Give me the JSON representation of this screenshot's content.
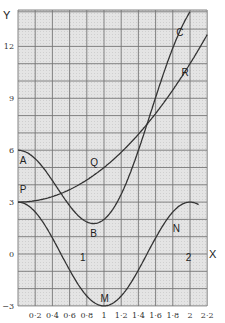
{
  "chart_data": {
    "type": "line",
    "title": "",
    "xlabel": "X",
    "ylabel": "Y",
    "xlim": [
      0,
      2.2
    ],
    "ylim": [
      -3,
      14.1
    ],
    "grid": true,
    "x_ticks": [
      "0·2",
      "0·4",
      "0·6",
      "0·8",
      "1",
      "1·2",
      "1·4",
      "1·6",
      "1·8",
      "2",
      "2·2"
    ],
    "y_ticks": [
      "12",
      "9",
      "6",
      "3",
      "0",
      "−3"
    ],
    "series": [
      {
        "name": "A-B-C",
        "labels": [
          "A",
          "B",
          "C"
        ],
        "x": [
          0,
          0.2,
          0.4,
          0.6,
          0.8,
          0.9,
          1.0,
          1.2,
          1.4,
          1.5,
          1.6,
          1.8,
          1.95
        ],
        "values": [
          6,
          5.93,
          4.25,
          2.79,
          1.86,
          1.77,
          2.0,
          3.46,
          5.85,
          7.5,
          9.19,
          11.91,
          14.4
        ]
      },
      {
        "name": "P-Q-R",
        "labels": [
          "P",
          "Q",
          "R"
        ],
        "x": [
          0,
          0.2,
          0.4,
          0.6,
          0.8,
          0.9,
          1.0,
          1.2,
          1.4,
          1.6,
          1.8,
          2.0,
          2.2
        ],
        "values": [
          3,
          3.08,
          3.32,
          3.72,
          4.28,
          4.62,
          5,
          5.88,
          6.92,
          8.12,
          9.48,
          11,
          12.68
        ]
      },
      {
        "name": "P-M-N",
        "labels": [
          "P",
          "M",
          "N"
        ],
        "x": [
          0,
          0.2,
          0.4,
          0.6,
          0.8,
          1.0,
          1.2,
          1.4,
          1.6,
          1.8,
          2.0,
          2.1
        ],
        "values": [
          3,
          2.43,
          0.93,
          -0.93,
          -2.43,
          -3,
          -2.43,
          -0.93,
          0.93,
          2.43,
          3,
          2.85
        ]
      }
    ],
    "annotations": [
      {
        "text": "A",
        "x": 0.02,
        "y": 5.2
      },
      {
        "text": "P",
        "x": 0.02,
        "y": 3.5
      },
      {
        "text": "Q",
        "x": 0.84,
        "y": 5.1
      },
      {
        "text": "B",
        "x": 0.84,
        "y": 1.0
      },
      {
        "text": "C",
        "x": 1.84,
        "y": 12.6
      },
      {
        "text": "R",
        "x": 1.9,
        "y": 10.3
      },
      {
        "text": "N",
        "x": 1.8,
        "y": 1.3
      },
      {
        "text": "M",
        "x": 0.96,
        "y": -2.8
      },
      {
        "text": "1",
        "x": 0.72,
        "y": -0.4
      },
      {
        "text": "2",
        "x": 1.95,
        "y": -0.4
      }
    ]
  },
  "axes": {
    "x_label": "X",
    "y_label": "Y"
  }
}
